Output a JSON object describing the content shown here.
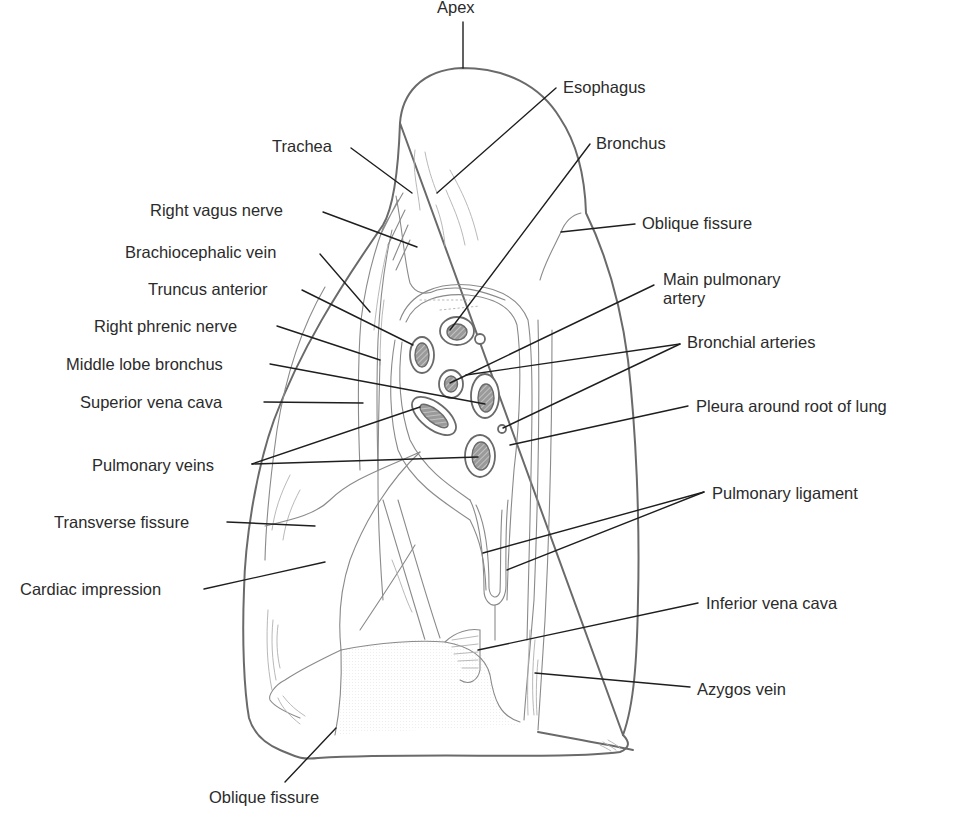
{
  "figure": {
    "colors": {
      "outline": "#6a6a6a",
      "leader": "#1e1e1e",
      "text": "#2b2b2b",
      "hatch": "#8a8a8a",
      "background": "#ffffff"
    }
  },
  "labels": [
    {
      "id": "apex",
      "text": "Apex",
      "x": 437,
      "y": 5,
      "align": "left",
      "leader": [
        [
          463,
          22
        ],
        [
          463,
          68
        ]
      ]
    },
    {
      "id": "esophagus",
      "text": "Esophagus",
      "x": 563,
      "y": 78,
      "align": "left",
      "leader": [
        [
          556,
          88
        ],
        [
          437,
          193
        ]
      ]
    },
    {
      "id": "bronchus",
      "text": "Bronchus",
      "x": 596,
      "y": 134,
      "align": "left",
      "leader": [
        [
          590,
          144
        ],
        [
          450,
          330
        ]
      ]
    },
    {
      "id": "trachea",
      "text": "Trachea",
      "x": 272,
      "y": 135,
      "align": "left",
      "leader": [
        [
          351,
          148
        ],
        [
          412,
          193
        ]
      ]
    },
    {
      "id": "oblique-fissure-upper",
      "text": "Oblique fissure",
      "x": 642,
      "y": 214,
      "align": "left",
      "leader": [
        [
          635,
          224
        ],
        [
          561,
          232
        ]
      ]
    },
    {
      "id": "right-vagus-nerve",
      "text": "Right vagus nerve",
      "x": 150,
      "y": 200,
      "align": "left",
      "leader": [
        [
          323,
          212
        ],
        [
          417,
          247
        ]
      ]
    },
    {
      "id": "brachiocephalic-vein",
      "text": "Brachiocephalic vein",
      "x": 125,
      "y": 241,
      "align": "left",
      "leader": [
        [
          320,
          254
        ],
        [
          370,
          312
        ]
      ]
    },
    {
      "id": "main-pulmonary-artery",
      "text": "Main pulmonary artery",
      "text_line1": "Main pulmonary",
      "text_line2": "artery",
      "x": 663,
      "y": 270,
      "align": "left",
      "leader": [
        [
          654,
          285
        ],
        [
          450,
          383
        ]
      ]
    },
    {
      "id": "truncus-anterior",
      "text": "Truncus anterior",
      "x": 148,
      "y": 280,
      "align": "left",
      "leader": [
        [
          302,
          290
        ],
        [
          413,
          345
        ]
      ]
    },
    {
      "id": "right-phrenic-nerve",
      "text": "Right phrenic nerve",
      "x": 94,
      "y": 317,
      "align": "left",
      "leader": [
        [
          277,
          326
        ],
        [
          380,
          360
        ]
      ]
    },
    {
      "id": "bronchial-arteries",
      "text": "Bronchial arteries",
      "x": 687,
      "y": 333,
      "align": "left",
      "leader": [
        [
          680,
          344
        ],
        [
          466,
          375
        ]
      ],
      "leader2": [
        [
          680,
          344
        ],
        [
          503,
          428
        ]
      ]
    },
    {
      "id": "middle-lobe-bronchus",
      "text": "Middle lobe bronchus",
      "x": 66,
      "y": 357,
      "align": "left",
      "leader": [
        [
          270,
          364
        ],
        [
          485,
          404
        ]
      ]
    },
    {
      "id": "superior-vena-cava",
      "text": "Superior vena cava",
      "x": 80,
      "y": 395,
      "align": "left",
      "leader": [
        [
          264,
          402
        ],
        [
          363,
          403
        ]
      ]
    },
    {
      "id": "pleura-around-root-of-lung",
      "text": "Pleura around root of lung",
      "x": 696,
      "y": 397,
      "align": "left",
      "leader": [
        [
          688,
          406
        ],
        [
          510,
          445
        ]
      ]
    },
    {
      "id": "pulmonary-veins",
      "text": "Pulmonary veins",
      "x": 92,
      "y": 457,
      "align": "left",
      "leader": [
        [
          252,
          464
        ],
        [
          420,
          407
        ]
      ],
      "leader2": [
        [
          252,
          464
        ],
        [
          478,
          457
        ]
      ]
    },
    {
      "id": "pulmonary-ligament",
      "text": "Pulmonary ligament",
      "x": 712,
      "y": 484,
      "align": "left",
      "leader": [
        [
          704,
          492
        ],
        [
          483,
          553
        ]
      ],
      "leader2": [
        [
          704,
          492
        ],
        [
          507,
          570
        ]
      ]
    },
    {
      "id": "transverse-fissure",
      "text": "Transverse fissure",
      "x": 54,
      "y": 514,
      "align": "left",
      "leader": [
        [
          227,
          522
        ],
        [
          315,
          526
        ]
      ]
    },
    {
      "id": "cardiac-impression",
      "text": "Cardiac impression",
      "x": 20,
      "y": 580,
      "align": "left",
      "leader": [
        [
          204,
          589
        ],
        [
          325,
          562
        ]
      ]
    },
    {
      "id": "inferior-vena-cava",
      "text": "Inferior vena cava",
      "x": 706,
      "y": 594,
      "align": "left",
      "leader": [
        [
          698,
          603
        ],
        [
          478,
          650
        ]
      ]
    },
    {
      "id": "azygos-vein",
      "text": "Azygos vein",
      "x": 697,
      "y": 681,
      "align": "left",
      "leader": [
        [
          690,
          687
        ],
        [
          535,
          673
        ]
      ]
    },
    {
      "id": "oblique-fissure-lower",
      "text": "Oblique fissure",
      "x": 209,
      "y": 788,
      "align": "left",
      "leader": [
        [
          285,
          782
        ],
        [
          336,
          728
        ]
      ]
    }
  ]
}
